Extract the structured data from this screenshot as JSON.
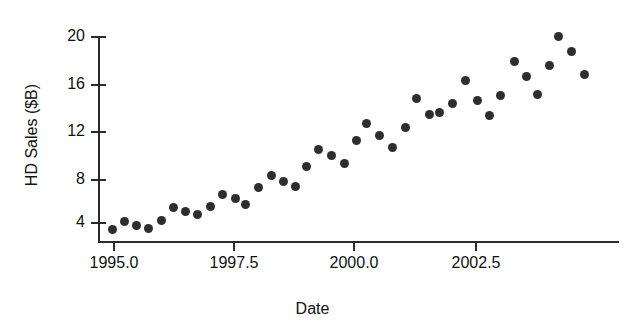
{
  "chart_data": {
    "type": "scatter",
    "title": "",
    "xlabel": "Date",
    "ylabel": "HD Sales ($B)",
    "xlim": [
      1994.7,
      2004.5
    ],
    "ylim": [
      2.5,
      21.0
    ],
    "xticks": [
      "1995.0",
      "1997.5",
      "2000.0",
      "2002.5"
    ],
    "xtick_values": [
      1995.0,
      1997.5,
      2000.0,
      2002.5
    ],
    "yticks": [
      "4",
      "8",
      "12",
      "16",
      "20"
    ],
    "ytick_values": [
      4,
      8,
      12,
      16,
      20
    ],
    "grid": false,
    "legend": false,
    "marker": "filled-circle",
    "marker_color": "#2e2e2e",
    "axis_color": "#2b2b2b",
    "background": "#ffffff",
    "points": [
      {
        "x": 1994.98,
        "y": 3.5
      },
      {
        "x": 1995.21,
        "y": 4.2
      },
      {
        "x": 1995.46,
        "y": 3.9
      },
      {
        "x": 1995.71,
        "y": 3.6
      },
      {
        "x": 1995.97,
        "y": 4.3
      },
      {
        "x": 1996.23,
        "y": 5.3
      },
      {
        "x": 1996.47,
        "y": 5.0
      },
      {
        "x": 1996.73,
        "y": 4.8
      },
      {
        "x": 1996.99,
        "y": 5.5
      },
      {
        "x": 1997.25,
        "y": 6.5
      },
      {
        "x": 1997.5,
        "y": 6.2
      },
      {
        "x": 1997.73,
        "y": 5.7
      },
      {
        "x": 1997.99,
        "y": 7.1
      },
      {
        "x": 1998.26,
        "y": 8.1
      },
      {
        "x": 1998.5,
        "y": 7.6
      },
      {
        "x": 1998.74,
        "y": 7.2
      },
      {
        "x": 1998.98,
        "y": 8.9
      },
      {
        "x": 1999.22,
        "y": 10.4
      },
      {
        "x": 1999.5,
        "y": 9.8
      },
      {
        "x": 1999.76,
        "y": 9.1
      },
      {
        "x": 2000.01,
        "y": 11.1
      },
      {
        "x": 2000.23,
        "y": 12.5
      },
      {
        "x": 2000.49,
        "y": 11.5
      },
      {
        "x": 2000.76,
        "y": 10.4
      },
      {
        "x": 2001.02,
        "y": 12.1
      },
      {
        "x": 2001.27,
        "y": 14.6
      },
      {
        "x": 2001.53,
        "y": 13.3
      },
      {
        "x": 2001.74,
        "y": 13.5
      },
      {
        "x": 2002.02,
        "y": 14.3
      },
      {
        "x": 2002.27,
        "y": 16.3
      },
      {
        "x": 2002.53,
        "y": 14.6
      },
      {
        "x": 2002.77,
        "y": 13.2
      },
      {
        "x": 2002.99,
        "y": 14.9
      },
      {
        "x": 2003.28,
        "y": 17.8
      },
      {
        "x": 2003.53,
        "y": 16.5
      },
      {
        "x": 2003.77,
        "y": 15.0
      },
      {
        "x": 2004.01,
        "y": 17.4
      },
      {
        "x": 2004.2,
        "y": 20.0
      },
      {
        "x": 2004.47,
        "y": 18.7
      },
      {
        "x": 2004.72,
        "y": 16.7
      }
    ],
    "pixel_points": [
      {
        "px": 112.7,
        "py": 229.0
      },
      {
        "px": 124.3,
        "py": 221.0
      },
      {
        "px": 136.0,
        "py": 225.0
      },
      {
        "px": 148.3,
        "py": 228.3
      },
      {
        "px": 161.0,
        "py": 220.0
      },
      {
        "px": 173.3,
        "py": 207.7
      },
      {
        "px": 185.0,
        "py": 211.7
      },
      {
        "px": 197.7,
        "py": 214.3
      },
      {
        "px": 210.0,
        "py": 206.0
      },
      {
        "px": 222.7,
        "py": 194.3
      },
      {
        "px": 235.0,
        "py": 198.3
      },
      {
        "px": 245.7,
        "py": 204.3
      },
      {
        "px": 258.3,
        "py": 187.7
      },
      {
        "px": 271.7,
        "py": 175.7
      },
      {
        "px": 283.3,
        "py": 181.7
      },
      {
        "px": 295.0,
        "py": 186.0
      },
      {
        "px": 306.7,
        "py": 166.0
      },
      {
        "px": 318.3,
        "py": 149.0
      },
      {
        "px": 331.7,
        "py": 155.7
      },
      {
        "px": 344.3,
        "py": 163.3
      },
      {
        "px": 356.0,
        "py": 140.0
      },
      {
        "px": 366.7,
        "py": 123.3
      },
      {
        "px": 379.3,
        "py": 135.0
      },
      {
        "px": 392.7,
        "py": 147.7
      },
      {
        "px": 405.0,
        "py": 127.7
      },
      {
        "px": 416.7,
        "py": 98.3
      },
      {
        "px": 429.3,
        "py": 114.3
      },
      {
        "px": 439.3,
        "py": 112.3
      },
      {
        "px": 452.7,
        "py": 103.3
      },
      {
        "px": 465.0,
        "py": 80.0
      },
      {
        "px": 477.7,
        "py": 100.0
      },
      {
        "px": 489.3,
        "py": 115.7
      },
      {
        "px": 500.0,
        "py": 95.0
      },
      {
        "px": 514.0,
        "py": 61.0
      },
      {
        "px": 526.0,
        "py": 76.7
      },
      {
        "px": 537.7,
        "py": 94.0
      },
      {
        "px": 549.3,
        "py": 65.7
      },
      {
        "px": 558.3,
        "py": 36.7
      },
      {
        "px": 571.7,
        "py": 51.7
      },
      {
        "px": 584.0,
        "py": 74.3
      }
    ]
  },
  "axes": {
    "y_title": "HD Sales ($B)",
    "x_title": "Date",
    "y_tick_labels": [
      "20",
      "16",
      "12",
      "8",
      "4"
    ],
    "y_tick_pixels": [
      37,
      85,
      132,
      180,
      223
    ],
    "x_tick_labels": [
      "1995.0",
      "1997.5",
      "2000.0",
      "2002.5"
    ],
    "x_tick_pixels": [
      114,
      234,
      354,
      476
    ]
  }
}
